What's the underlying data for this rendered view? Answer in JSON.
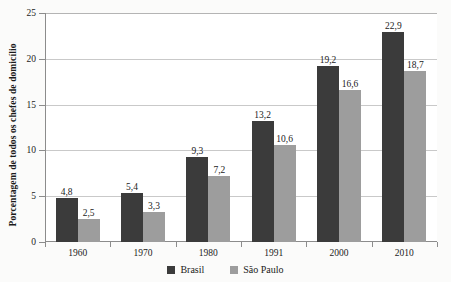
{
  "chart_data": {
    "type": "bar",
    "title": "",
    "xlabel": "",
    "ylabel": "Porcentagem de todos os chefes de domicílio",
    "categories": [
      "1960",
      "1970",
      "1980",
      "1991",
      "2000",
      "2010"
    ],
    "ylim": [
      0,
      25
    ],
    "yticks": [
      0,
      5,
      10,
      15,
      20,
      25
    ],
    "ytick_labels": [
      "0",
      "5",
      "10",
      "15",
      "20",
      "25"
    ],
    "grid": true,
    "legend_position": "bottom",
    "series": [
      {
        "name": "Brasil",
        "color": "#3b3b3b",
        "values": [
          4.8,
          5.4,
          9.3,
          13.2,
          19.2,
          22.9
        ],
        "labels": [
          "4,8",
          "5,4",
          "9,3",
          "13,2",
          "19,2",
          "22,9"
        ]
      },
      {
        "name": "São Paulo",
        "color": "#9d9d9d",
        "values": [
          2.5,
          3.3,
          7.2,
          10.6,
          16.6,
          18.7
        ],
        "labels": [
          "2,5",
          "3,3",
          "7,2",
          "10,6",
          "16,6",
          "18,7"
        ]
      }
    ]
  }
}
